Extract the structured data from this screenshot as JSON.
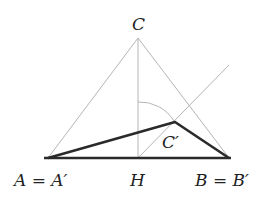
{
  "diagram": {
    "type": "geometry",
    "points": {
      "A": {
        "x": 48,
        "y": 158,
        "label": "A = A′"
      },
      "B": {
        "x": 229,
        "y": 158,
        "label": "B = B′"
      },
      "C": {
        "x": 138,
        "y": 38,
        "label": "C"
      },
      "H": {
        "x": 138,
        "y": 158,
        "label": "H"
      },
      "C_prime": {
        "x": 175,
        "y": 122,
        "label": "C′"
      }
    },
    "labels": {
      "C": "C",
      "C_prime": "C′",
      "A": "A = A′",
      "H": "H",
      "B": "B = B′"
    },
    "colors": {
      "thin_line": "#b5b5b5",
      "thick_line": "#2a2a2a",
      "text": "#222222",
      "background": "#ffffff"
    }
  }
}
